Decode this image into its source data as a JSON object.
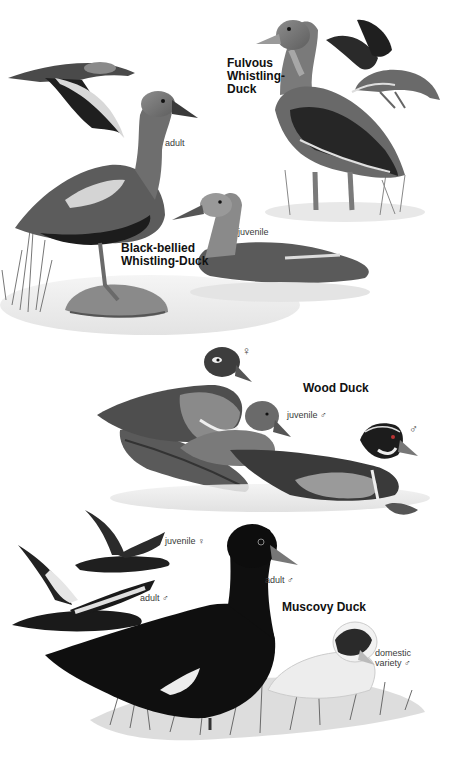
{
  "plate": {
    "species": [
      {
        "name_lines": [
          "Fulvous",
          "Whistling-",
          "Duck"
        ],
        "labels": []
      },
      {
        "name_lines": [
          "Black-bellied",
          "Whistling-Duck"
        ],
        "labels": [
          "adult",
          "juvenile"
        ]
      },
      {
        "name_lines": [
          "Wood Duck"
        ],
        "labels": [
          "♀",
          "juvenile ♂",
          "♂"
        ]
      },
      {
        "name_lines": [
          "Muscovy Duck"
        ],
        "labels": [
          "juvenile ♀",
          "adult ♂",
          "adult ♂",
          "domestic",
          "variety ♂"
        ]
      }
    ]
  },
  "colors": {
    "background": "#ffffff",
    "text": "#111111",
    "label": "#3a3a3a",
    "plumage_dark": "#1a1a1a",
    "plumage_mid": "#6e6e6e",
    "plumage_light": "#b9b9b9",
    "water": "#e6e6e6"
  }
}
